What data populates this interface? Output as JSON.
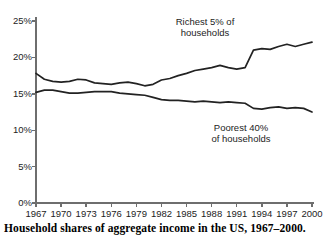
{
  "caption": "Household shares of aggregate income in the US, 1967–2000.",
  "annotations": {
    "richest_line1": "Richest 5% of",
    "richest_line2": "households",
    "poorest_line1": "Poorest 40%",
    "poorest_line2": "of households"
  },
  "axis": {
    "y_ticks": [
      "0%",
      "5%",
      "10%",
      "15%",
      "20%",
      "25%"
    ],
    "x_ticks": [
      "1967",
      "1970",
      "1973",
      "1976",
      "1979",
      "1982",
      "1985",
      "1988",
      "1991",
      "1994",
      "1997",
      "2000"
    ]
  },
  "chart_data": {
    "type": "line",
    "title": "",
    "subtitle": "",
    "xlabel": "",
    "ylabel": "",
    "xlim": [
      1967,
      2000
    ],
    "ylim": [
      0,
      25
    ],
    "grid": false,
    "legend": "inline-annotations",
    "y_tick_values": [
      0,
      5,
      10,
      15,
      20,
      25
    ],
    "y_tick_labels": [
      "0%",
      "5%",
      "10%",
      "15%",
      "20%",
      "25%"
    ],
    "x_tick_values": [
      1967,
      1970,
      1973,
      1976,
      1979,
      1982,
      1985,
      1988,
      1991,
      1994,
      1997,
      2000
    ],
    "x_tick_labels": [
      "1967",
      "1970",
      "1973",
      "1976",
      "1979",
      "1982",
      "1985",
      "1988",
      "1991",
      "1994",
      "1997",
      "2000"
    ],
    "x": [
      1967,
      1968,
      1969,
      1970,
      1971,
      1972,
      1973,
      1974,
      1975,
      1976,
      1977,
      1978,
      1979,
      1980,
      1981,
      1982,
      1983,
      1984,
      1985,
      1986,
      1987,
      1988,
      1989,
      1990,
      1991,
      1992,
      1993,
      1994,
      1995,
      1996,
      1997,
      1998,
      1999,
      2000
    ],
    "series": [
      {
        "name": "Richest 5% of households",
        "color": "#222222",
        "annotation": "Richest 5% of households",
        "values": [
          17.8,
          17.0,
          16.7,
          16.6,
          16.7,
          17.0,
          16.9,
          16.5,
          16.4,
          16.3,
          16.5,
          16.6,
          16.4,
          16.1,
          16.3,
          16.9,
          17.1,
          17.5,
          17.8,
          18.2,
          18.4,
          18.6,
          18.9,
          18.6,
          18.4,
          18.6,
          21.0,
          21.2,
          21.1,
          21.5,
          21.8,
          21.5,
          21.8,
          22.1
        ]
      },
      {
        "name": "Poorest 40% of households",
        "color": "#222222",
        "annotation": "Poorest 40% of households",
        "values": [
          15.2,
          15.5,
          15.5,
          15.3,
          15.1,
          15.1,
          15.2,
          15.3,
          15.3,
          15.3,
          15.1,
          15.0,
          14.9,
          14.8,
          14.5,
          14.2,
          14.1,
          14.1,
          14.0,
          13.9,
          14.0,
          13.9,
          13.8,
          13.9,
          13.8,
          13.7,
          13.0,
          12.9,
          13.1,
          13.2,
          13.0,
          13.1,
          13.0,
          12.5
        ]
      }
    ]
  },
  "colors": {
    "line": "#222222",
    "axis": "#6e6e6e",
    "text": "#232323",
    "caption": "#000000",
    "background": "#ffffff"
  }
}
